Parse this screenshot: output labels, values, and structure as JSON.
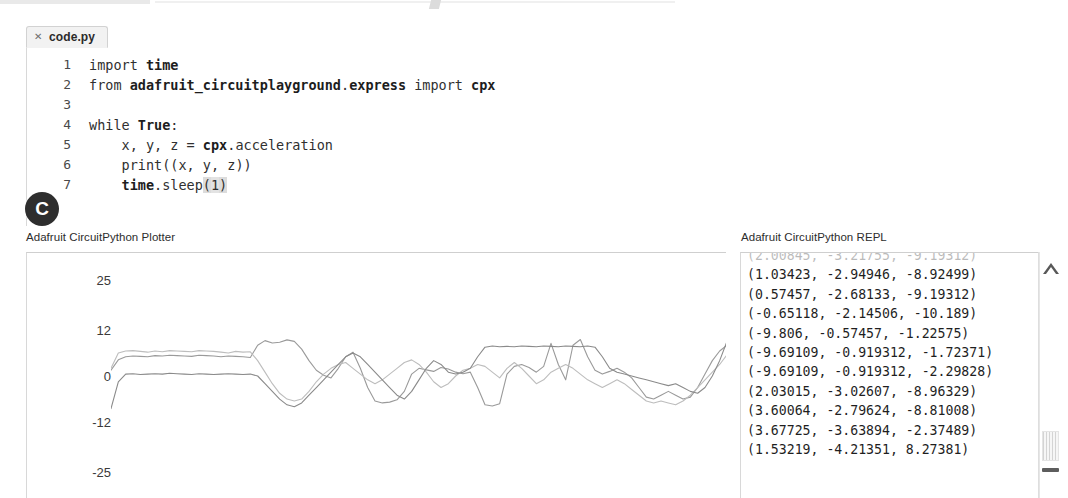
{
  "window": {
    "app_name": "Mu Editor",
    "theme_background": "#ffffff"
  },
  "tabbar": {
    "tabs": [
      {
        "title": "code.py",
        "close_glyph": "✕",
        "active": true
      }
    ]
  },
  "editor": {
    "language": "python",
    "lines": [
      {
        "no": "1",
        "text": "import time"
      },
      {
        "no": "2",
        "text": "from adafruit_circuitplayground.express import cpx"
      },
      {
        "no": "3",
        "text": ""
      },
      {
        "no": "4",
        "text": "while True:"
      },
      {
        "no": "5",
        "text": "    x, y, z = cpx.acceleration"
      },
      {
        "no": "6",
        "text": "    print((x, y, z))"
      },
      {
        "no": "7",
        "text": "    time.sleep(1)"
      }
    ]
  },
  "callout": {
    "letter": "C"
  },
  "panes": {
    "plotter_label": "Adafruit CircuitPython Plotter",
    "repl_label": "Adafruit CircuitPython REPL"
  },
  "repl": {
    "lines": [
      {
        "text": "(2.00845, -3.21755, -9.19312)",
        "clipped": true
      },
      {
        "text": "(1.03423, -2.94946, -8.92499)",
        "clipped": false
      },
      {
        "text": "(0.57457, -2.68133, -9.19312)",
        "clipped": false
      },
      {
        "text": "(-0.65118, -2.14506, -10.189)",
        "clipped": false
      },
      {
        "text": "(-9.806, -0.57457, -1.22575)",
        "clipped": false
      },
      {
        "text": "(-9.69109, -0.919312, -1.72371)",
        "clipped": false
      },
      {
        "text": "(-9.69109, -0.919312, -2.29828)",
        "clipped": false
      },
      {
        "text": "(2.03015, -3.02607, -8.96329)",
        "clipped": false
      },
      {
        "text": "(3.60064, -2.79624, -8.81008)",
        "clipped": false
      },
      {
        "text": "(3.67725, -3.63894, -2.37489)",
        "clipped": false
      },
      {
        "text": "(1.53219, -4.21351, 8.27381)",
        "clipped": false
      }
    ]
  },
  "scrollbar": {
    "up_arrow_glyph": "△",
    "thumb_position_pct": 73
  },
  "chart_data": {
    "type": "line",
    "title": "Adafruit CircuitPython Plotter",
    "xlabel": "",
    "ylabel": "",
    "grid": false,
    "legend": false,
    "ylim": [
      -32,
      32
    ],
    "ytick_labels": [
      "25",
      "12",
      "0",
      "-12",
      "-25"
    ],
    "ytick_values": [
      25,
      12,
      0,
      -12,
      -25
    ],
    "xtick_labels": [],
    "colors": {
      "x": "#9a9a9a",
      "y": "#b2b2b2",
      "z": "#8c8c8c"
    },
    "series": [
      {
        "name": "x",
        "color": "#9a9a9a",
        "values": [
          1.5,
          4.2,
          5.0,
          5.2,
          5.1,
          5.0,
          5.3,
          5.2,
          5.4,
          5.3,
          5.2,
          5.1,
          5.4,
          5.3,
          5.2,
          5.0,
          5.2,
          5.1,
          5.0,
          4.8,
          8.0,
          9.2,
          8.6,
          8.8,
          9.4,
          9.0,
          7.0,
          4.0,
          1.5,
          0.2,
          -0.5,
          2.0,
          5.0,
          6.2,
          2.0,
          -3.0,
          -6.5,
          -7.0,
          -6.8,
          -6.2,
          -4.0,
          0.5,
          2.0,
          1.6,
          1.2,
          2.2,
          1.8,
          1.0,
          0.6,
          1.0,
          -3.0,
          -7.5,
          -7.8,
          -7.2,
          0.5,
          2.5,
          3.0,
          2.2,
          1.0,
          2.5,
          8.5,
          3.0,
          -1.0,
          8.0,
          9.5,
          5.0,
          1.5,
          0.5,
          1.2,
          2.0,
          1.0,
          -0.5,
          -3.0,
          -5.5,
          -6.0,
          -5.0,
          -4.0,
          -5.0,
          -6.0,
          -5.5,
          -3.0,
          0.5,
          4.0,
          6.5,
          8.0
        ]
      },
      {
        "name": "y",
        "color": "#bdbdbd",
        "values": [
          2.0,
          6.0,
          6.5,
          6.6,
          6.4,
          6.2,
          6.5,
          6.3,
          6.6,
          6.5,
          6.4,
          6.3,
          6.6,
          6.5,
          6.4,
          6.2,
          6.0,
          6.4,
          6.2,
          6.3,
          4.0,
          1.0,
          -2.0,
          -4.5,
          -6.0,
          -6.5,
          -6.0,
          -4.0,
          -1.5,
          0.5,
          2.0,
          3.0,
          3.5,
          2.0,
          0.5,
          -1.0,
          -2.0,
          -1.0,
          0.5,
          2.0,
          3.5,
          4.2,
          3.0,
          1.0,
          -1.5,
          -3.0,
          -2.0,
          0.0,
          1.5,
          2.0,
          3.0,
          2.5,
          1.0,
          -0.5,
          2.0,
          3.5,
          2.0,
          0.0,
          -2.0,
          -1.0,
          1.0,
          2.0,
          3.0,
          2.0,
          0.5,
          -1.0,
          -2.0,
          -3.0,
          -2.0,
          -1.0,
          -2.0,
          -3.5,
          -5.0,
          -6.5,
          -7.0,
          -6.5,
          -7.0,
          -7.5,
          -6.5,
          -5.0,
          -3.0,
          -1.0,
          1.0,
          3.0,
          5.5
        ]
      },
      {
        "name": "z",
        "color": "#8a8a8a",
        "values": [
          -8.5,
          -1.5,
          0.5,
          0.6,
          0.4,
          0.5,
          0.6,
          0.5,
          0.7,
          0.6,
          0.5,
          0.4,
          0.6,
          0.5,
          0.4,
          0.5,
          0.6,
          0.5,
          0.4,
          0.5,
          0.0,
          -2.0,
          -4.0,
          -6.0,
          -7.5,
          -8.0,
          -7.0,
          -5.0,
          -3.0,
          -1.0,
          1.0,
          3.0,
          5.0,
          6.0,
          5.0,
          3.0,
          1.0,
          -1.0,
          -3.0,
          -5.0,
          -6.0,
          -4.0,
          -1.0,
          2.0,
          4.0,
          3.0,
          1.0,
          0.5,
          1.0,
          2.0,
          5.0,
          7.5,
          7.8,
          7.6,
          7.7,
          7.6,
          7.8,
          7.7,
          7.6,
          7.8,
          7.7,
          7.6,
          7.8,
          7.7,
          7.6,
          7.8,
          7.5,
          5.0,
          2.0,
          1.0,
          0.5,
          0.0,
          -0.5,
          -1.0,
          -1.5,
          -2.0,
          -2.5,
          -2.0,
          -3.0,
          -4.0,
          -4.5,
          -3.0,
          0.0,
          4.0,
          9.0
        ]
      }
    ]
  }
}
